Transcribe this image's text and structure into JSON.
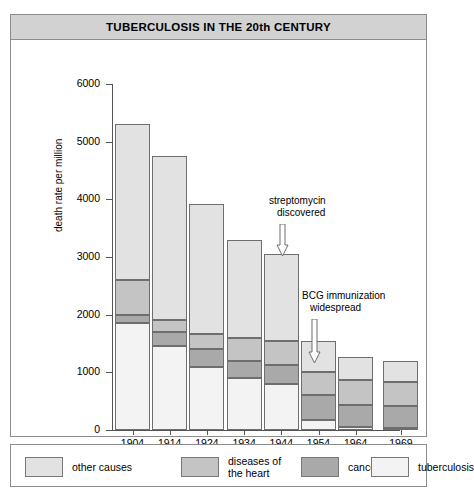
{
  "header": {
    "title": "TUBERCULOSIS IN THE 20th CENTURY"
  },
  "legend": {
    "items": [
      {
        "label": "other causes",
        "color": "#e2e2e2",
        "key": "other_causes"
      },
      {
        "label": "diseases of\nthe heart",
        "label_line1": "diseases of",
        "label_line2": "the heart",
        "color": "#c4c4c4",
        "key": "heart"
      },
      {
        "label": "cancer",
        "color": "#a9a9a9",
        "key": "cancer"
      },
      {
        "label": "tuberculosis",
        "color": "#f3f3f3",
        "key": "tuberculosis"
      }
    ]
  },
  "annotations": [
    {
      "line1": "streptomycin",
      "line2": "discovered",
      "at_year": "1944"
    },
    {
      "line1": "BCG immunization",
      "line2": "widespread",
      "at_year": "1954"
    }
  ],
  "chart_data": {
    "type": "bar",
    "stacked": true,
    "title": "TUBERCULOSIS IN THE 20th CENTURY",
    "xlabel": "",
    "ylabel": "death rate per million",
    "ylim": [
      0,
      6000
    ],
    "yticks": [
      0,
      1000,
      2000,
      3000,
      4000,
      5000,
      6000
    ],
    "ytick_labels": [
      "0",
      "1000",
      "2000",
      "3000",
      "4000",
      "5000",
      "6000"
    ],
    "grid": false,
    "legend_position": "below",
    "categories": [
      "1904",
      "1914",
      "1924",
      "1934",
      "1944",
      "1954",
      "1964",
      "1969"
    ],
    "stack_order_bottom_to_top": [
      "tuberculosis",
      "cancer",
      "heart",
      "other causes"
    ],
    "series": [
      {
        "name": "tuberculosis",
        "color": "#f3f3f3",
        "values": [
          1850,
          1450,
          1100,
          900,
          800,
          180,
          60,
          40
        ]
      },
      {
        "name": "cancer",
        "color": "#a9a9a9",
        "values": [
          150,
          250,
          300,
          300,
          330,
          420,
          380,
          370
        ]
      },
      {
        "name": "heart",
        "color": "#c4c4c4",
        "values": [
          600,
          200,
          270,
          400,
          420,
          400,
          420,
          430
        ]
      },
      {
        "name": "other causes",
        "color": "#e2e2e2",
        "values": [
          2700,
          2850,
          2250,
          1700,
          1500,
          550,
          400,
          360
        ]
      }
    ],
    "totals": [
      5300,
      4750,
      3920,
      3300,
      3050,
      1550,
      1260,
      1200
    ],
    "cumulative_tops": {
      "1904": {
        "tuberculosis": 1850,
        "cancer": 2000,
        "heart": 2600,
        "other causes": 5300
      },
      "1914": {
        "tuberculosis": 1450,
        "cancer": 1700,
        "heart": 1900,
        "other causes": 4750
      },
      "1924": {
        "tuberculosis": 1100,
        "cancer": 1400,
        "heart": 1670,
        "other causes": 3920
      },
      "1934": {
        "tuberculosis": 900,
        "cancer": 1200,
        "heart": 1600,
        "other causes": 3300
      },
      "1944": {
        "tuberculosis": 800,
        "cancer": 1130,
        "heart": 1550,
        "other causes": 3050
      },
      "1954": {
        "tuberculosis": 180,
        "cancer": 600,
        "heart": 1000,
        "other causes": 1550
      },
      "1964": {
        "tuberculosis": 60,
        "cancer": 440,
        "heart": 860,
        "other causes": 1260
      },
      "1969": {
        "tuberculosis": 40,
        "cancer": 410,
        "heart": 840,
        "other causes": 1200
      }
    }
  }
}
